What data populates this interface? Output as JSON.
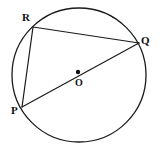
{
  "figure": {
    "name": "circle-with-inscribed-triangle",
    "width": 160,
    "height": 159,
    "background_color": "#ffffff",
    "stroke_color": "#1a1a1a",
    "label_color": "#111111"
  },
  "circle": {
    "center_x": 79,
    "center_y": 75,
    "radius": 67
  },
  "points": {
    "R": {
      "label": "R",
      "x": 33,
      "y": 27,
      "label_x": 22,
      "label_y": 12
    },
    "Q": {
      "label": "Q",
      "x": 139,
      "y": 43,
      "label_x": 141,
      "label_y": 35
    },
    "P": {
      "label": "P",
      "x": 22,
      "y": 107,
      "label_x": 11,
      "label_y": 105
    },
    "O": {
      "label": "O",
      "x": 78,
      "y": 72,
      "label_x": 75,
      "label_y": 77,
      "dot_radius": 2.2
    }
  },
  "segments": [
    {
      "name": "chord-RQ",
      "from": "R",
      "to": "Q",
      "x1": 33,
      "y1": 27,
      "x2": 139,
      "y2": 43
    },
    {
      "name": "chord-RP",
      "from": "R",
      "to": "P",
      "x1": 33,
      "y1": 27,
      "x2": 22,
      "y2": 107
    },
    {
      "name": "diameter-PQ",
      "from": "P",
      "to": "Q",
      "x1": 22,
      "y1": 107,
      "x2": 139,
      "y2": 43
    }
  ]
}
